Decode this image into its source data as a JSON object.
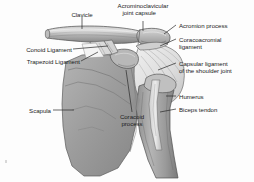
{
  "figure": {
    "background_color": "#fdfdfd",
    "text_color": "#1b1b1b",
    "leader_line_color": "#2a2a2a"
  },
  "palette": {
    "bone_light": "#d6d6d6",
    "bone_mid": "#a8a8a8",
    "bone_dark": "#8a8a8a",
    "bone_darker": "#6f6f6f",
    "capsule_light": "#e2e2e2",
    "outline": "#4a4a4a",
    "shadow": "#5e5e5e"
  },
  "labels": [
    {
      "id": "clavicle",
      "text": "Clavicle",
      "lines": [
        "Clavicle"
      ],
      "side": "top"
    },
    {
      "id": "ac-joint-capsule",
      "text": "Acrominoclavicular joint capsule",
      "lines": [
        "Acrominoclavicular",
        "joint capsule"
      ],
      "side": "top"
    },
    {
      "id": "acromion-process",
      "text": "Acromion process",
      "lines": [
        "Acromion process"
      ],
      "side": "right"
    },
    {
      "id": "coracoacromial-ligament",
      "text": "Coracoacromial ligament",
      "lines": [
        "Coracoacromial",
        "ligament"
      ],
      "side": "right"
    },
    {
      "id": "capsular-ligament",
      "text": "Capsular ligament of the shoulder joint",
      "lines": [
        "Capsular ligament",
        "of the shoulder joint"
      ],
      "side": "right"
    },
    {
      "id": "humerus",
      "text": "Humerus",
      "lines": [
        "Humerus"
      ],
      "side": "right"
    },
    {
      "id": "biceps-tendon",
      "text": "Biceps tendon",
      "lines": [
        "Biceps tendon"
      ],
      "side": "right"
    },
    {
      "id": "conoid-ligament",
      "text": "Conoid Ligament",
      "lines": [
        "Conoid Ligament"
      ],
      "side": "left"
    },
    {
      "id": "trapezoid-ligament",
      "text": "Trapezoid Ligament",
      "lines": [
        "Trapezoid Ligament"
      ],
      "side": "left"
    },
    {
      "id": "scapula",
      "text": "Scapula",
      "lines": [
        "Scapula"
      ],
      "side": "left"
    },
    {
      "id": "coracoid-process",
      "text": "Coracoid process",
      "lines": [
        "Coracoid",
        "process"
      ],
      "side": "bottom"
    }
  ],
  "label_text": {
    "clavicle": "Clavicle",
    "ac_joint_capsule_line1": "Acrominoclavicular",
    "ac_joint_capsule_line2": "joint capsule",
    "acromion_process": "Acromion process",
    "coracoacromial_line1": "Coracoacromial",
    "coracoacromial_line2": "ligament",
    "capsular_line1": "Capsular ligament",
    "capsular_line2": "of the shoulder joint",
    "humerus": "Humerus",
    "biceps_tendon": "Biceps tendon",
    "conoid_ligament": "Conoid Ligament",
    "trapezoid_ligament": "Trapezoid Ligament",
    "scapula": "Scapula",
    "coracoid_line1": "Coracoid",
    "coracoid_line2": "process"
  },
  "structures": [
    {
      "name": "clavicle",
      "description": "horizontal cylindrical bone, upper left, longitudinal shading"
    },
    {
      "name": "acromion",
      "description": "flat process at lateral end of clavicle"
    },
    {
      "name": "scapula",
      "description": "large triangular blade, mid-gray, lower left"
    },
    {
      "name": "coracoid-process",
      "description": "hook-shaped projection, center"
    },
    {
      "name": "humerus",
      "description": "long bone shaft descending to lower right"
    },
    {
      "name": "joint-capsule",
      "description": "pale fan of radiating fibers over glenohumeral joint"
    },
    {
      "name": "biceps-tendon",
      "description": "pale vertical band along humeral groove"
    },
    {
      "name": "conoid-ligament",
      "description": "short band from coracoid to clavicle"
    },
    {
      "name": "trapezoid-ligament",
      "description": "broad band from coracoid to clavicle"
    }
  ]
}
